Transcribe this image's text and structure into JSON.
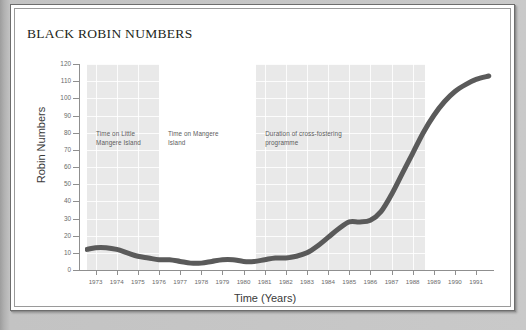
{
  "document": {
    "title": "BLACK ROBIN NUMBERS"
  },
  "chart_data": {
    "type": "line",
    "title": "BLACK ROBIN NUMBERS",
    "xlabel": "Time (Years)",
    "ylabel": "Robin Numbers",
    "xlim": [
      1972.5,
      1991.8
    ],
    "ylim": [
      0,
      120
    ],
    "grid": true,
    "legend": "none",
    "x_ticks": [
      "1973",
      "1974",
      "1975",
      "1976",
      "1977",
      "1978",
      "1979",
      "1980",
      "1981",
      "1982",
      "1983",
      "1984",
      "1985",
      "1986",
      "1987",
      "1988",
      "1989",
      "1990",
      "1991"
    ],
    "y_ticks": [
      "0",
      "10",
      "20",
      "30",
      "40",
      "50",
      "60",
      "70",
      "80",
      "90",
      "100",
      "110",
      "120"
    ],
    "series": [
      {
        "name": "Robin Numbers",
        "color": "#5a5a5a",
        "x": [
          1972.6,
          1973,
          1973.5,
          1974,
          1974.5,
          1975,
          1975.5,
          1976,
          1976.5,
          1977,
          1977.5,
          1978,
          1978.5,
          1979,
          1979.5,
          1980,
          1980.5,
          1981,
          1981.5,
          1982,
          1982.5,
          1983,
          1983.5,
          1984,
          1984.5,
          1985,
          1985.5,
          1986,
          1986.5,
          1987,
          1987.5,
          1988,
          1988.5,
          1989,
          1989.5,
          1990,
          1990.5,
          1991,
          1991.6
        ],
        "values": [
          12,
          13,
          13,
          12,
          10,
          8,
          7,
          6,
          6,
          5,
          4,
          4,
          5,
          6,
          6,
          5,
          5,
          6,
          7,
          7,
          8,
          10,
          14,
          19,
          24,
          28,
          28,
          29,
          34,
          44,
          56,
          68,
          80,
          90,
          98,
          104,
          108,
          111,
          113
        ]
      }
    ],
    "bands": [
      {
        "label": "Time on Little\nMangere Island",
        "x_start": 1972.6,
        "x_end": 1976.0,
        "shaded": true
      },
      {
        "label": "Time on Mangere\nIsland",
        "x_start": 1976.0,
        "x_end": 1980.6,
        "shaded": false
      },
      {
        "label": "Duration of cross-fostering\nprogramme",
        "x_start": 1980.6,
        "x_end": 1988.6,
        "shaded": true
      }
    ],
    "band_color": "#e9e9e9"
  }
}
